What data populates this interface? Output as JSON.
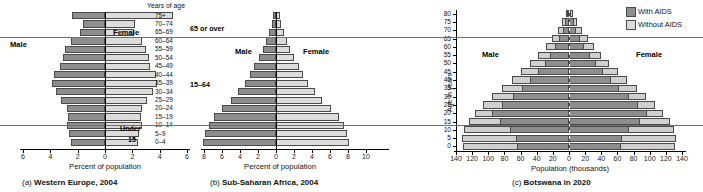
{
  "figure": {
    "age_header": "Years of age",
    "age_groups": [
      "75+",
      "70–74",
      "65–69",
      "60–64",
      "55–59",
      "50–54",
      "45–49",
      "40–44",
      "35–39",
      "30–34",
      "25–29",
      "20–24",
      "15–19",
      "10–14",
      "5–9",
      "0–4"
    ],
    "group_labels": {
      "over65": "65 or over",
      "working": "15–64",
      "under15_line1": "Under",
      "under15_line2": "15"
    },
    "series_labels": {
      "male": "Male",
      "female": "Female"
    }
  },
  "chart_data": [
    {
      "type": "bar",
      "subtype": "population-pyramid",
      "panel": "a",
      "title": "Western Europe, 2004",
      "caption_index": "(a)",
      "xlabel": "Percent of population",
      "ylabel": "Years of age",
      "categories": [
        "75+",
        "70–74",
        "65–69",
        "60–64",
        "55–59",
        "50–54",
        "45–49",
        "40–44",
        "35–39",
        "30–34",
        "25–29",
        "20–24",
        "15–19",
        "10–14",
        "5–9",
        "0–4"
      ],
      "xticks": [
        6,
        4,
        2,
        0,
        2,
        4,
        6
      ],
      "xlim": [
        -6,
        6
      ],
      "grid": false,
      "legend": "none",
      "series": [
        {
          "name": "Male",
          "color": "#8d8d8d",
          "values": [
            2.4,
            1.6,
            1.8,
            2.5,
            2.9,
            3.1,
            3.3,
            3.7,
            3.9,
            3.6,
            3.2,
            2.8,
            2.7,
            2.8,
            2.6,
            2.5
          ]
        },
        {
          "name": "Female",
          "color": "#dcdcdc",
          "values": [
            5.0,
            2.2,
            2.1,
            2.7,
            3.0,
            3.2,
            3.3,
            3.7,
            3.8,
            3.5,
            3.1,
            2.7,
            2.6,
            2.7,
            2.5,
            2.4
          ]
        }
      ]
    },
    {
      "type": "bar",
      "subtype": "population-pyramid",
      "panel": "b",
      "title": "Sub-Saharan Africa, 2004",
      "caption_index": "(b)",
      "xlabel": "Percent of population",
      "ylabel": "Years of age",
      "categories": [
        "75+",
        "70–74",
        "65–69",
        "60–64",
        "55–59",
        "50–54",
        "45–49",
        "40–44",
        "35–39",
        "30–34",
        "25–29",
        "20–24",
        "15–19",
        "10–14",
        "5–9",
        "0–4"
      ],
      "xticks": [
        8,
        6,
        4,
        2,
        0,
        2,
        4,
        6,
        8,
        10
      ],
      "xlim": [
        -10,
        10
      ],
      "grid": false,
      "legend": "none",
      "series": [
        {
          "name": "Male",
          "color": "#8d8d8d",
          "values": [
            0.3,
            0.5,
            0.8,
            1.1,
            1.5,
            1.9,
            2.4,
            2.9,
            3.5,
            4.2,
            5.0,
            6.0,
            6.9,
            7.5,
            7.9,
            8.1
          ]
        },
        {
          "name": "Female",
          "color": "#dcdcdc",
          "values": [
            0.4,
            0.6,
            0.9,
            1.2,
            1.6,
            2.0,
            2.5,
            3.0,
            3.6,
            4.3,
            5.1,
            6.1,
            7.0,
            7.5,
            7.9,
            8.1
          ]
        }
      ]
    },
    {
      "type": "bar",
      "subtype": "population-pyramid-overlay",
      "panel": "c",
      "title": "Botswana in 2020",
      "caption_index": "(c)",
      "xlabel": "Population (thousands)",
      "ylabel": "Age in years",
      "categories": [
        "80",
        "75",
        "70",
        "65",
        "60",
        "55",
        "50",
        "45",
        "40",
        "35",
        "30",
        "25",
        "20",
        "15",
        "10",
        "5",
        "0"
      ],
      "yticks": [
        80,
        75,
        70,
        65,
        60,
        55,
        50,
        45,
        40,
        35,
        30,
        25,
        20,
        15,
        10,
        5,
        0
      ],
      "xticks": [
        140,
        120,
        100,
        80,
        60,
        40,
        20,
        0,
        20,
        40,
        60,
        80,
        100,
        120,
        140
      ],
      "xlim": [
        -140,
        140
      ],
      "grid": false,
      "legend": {
        "position": "top-right",
        "entries": [
          {
            "label": "With AIDS",
            "color": "#8d8d8d"
          },
          {
            "label": "Without AIDS",
            "color": "#dcdcdc"
          }
        ]
      },
      "series": [
        {
          "name": "Male without AIDS",
          "color": "#cfcfcf",
          "values": [
            4,
            9,
            14,
            21,
            29,
            38,
            48,
            59,
            71,
            83,
            95,
            106,
            116,
            124,
            130,
            132,
            131
          ]
        },
        {
          "name": "Male with AIDS",
          "color": "#8d8d8d",
          "values": [
            2,
            5,
            8,
            12,
            17,
            23,
            30,
            38,
            48,
            58,
            70,
            83,
            95,
            86,
            73,
            66,
            64
          ]
        },
        {
          "name": "Female without AIDS",
          "color": "#cfcfcf",
          "values": [
            5,
            10,
            16,
            23,
            31,
            40,
            50,
            61,
            72,
            84,
            96,
            107,
            117,
            125,
            130,
            132,
            131
          ]
        },
        {
          "name": "Female with AIDS",
          "color": "#8d8d8d",
          "values": [
            3,
            6,
            9,
            14,
            19,
            26,
            33,
            42,
            52,
            62,
            74,
            86,
            97,
            88,
            74,
            66,
            64
          ]
        }
      ]
    }
  ]
}
